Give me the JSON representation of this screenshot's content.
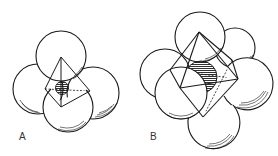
{
  "figures": [
    {
      "id": "A",
      "label": "A",
      "description": "Tetrahedral hole: four spheres with inscribed tetrahedron and small shaded interstitial sphere"
    },
    {
      "id": "B",
      "label": "B",
      "description": "Octahedral hole: six spheres with inscribed octahedron and larger shaded interstitial sphere"
    }
  ],
  "colors": {
    "line": "#1a1a1a",
    "background": "#ffffff",
    "label": "#333333"
  }
}
